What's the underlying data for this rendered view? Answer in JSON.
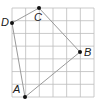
{
  "diagram": {
    "type": "quadrilateral-on-grid",
    "grid": {
      "x0": 12,
      "y0": 8,
      "x1": 94,
      "y1": 97,
      "cols": 6,
      "rows": 7,
      "line_color": "#bdbdbd"
    },
    "polygon": {
      "order": [
        "A",
        "B",
        "C",
        "D"
      ],
      "stroke": "#9a9a9a"
    },
    "points": [
      {
        "name": "A",
        "label": "A",
        "x": 25,
        "y": 97,
        "label_x": 13,
        "label_y": 84
      },
      {
        "name": "B",
        "label": "B",
        "x": 80,
        "y": 52,
        "label_x": 84,
        "label_y": 47
      },
      {
        "name": "C",
        "label": "C",
        "x": 39,
        "y": 8,
        "label_x": 34,
        "label_y": 12
      },
      {
        "name": "D",
        "label": "D",
        "x": 12,
        "y": 23,
        "label_x": 1,
        "label_y": 17
      }
    ],
    "point_color": "#111111"
  }
}
